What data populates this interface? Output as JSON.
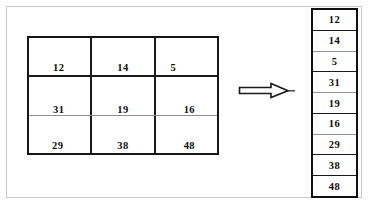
{
  "diagram": {
    "frame": {
      "border_color": "#c9c9c9",
      "background": "#ffffff"
    },
    "matrix": {
      "name": "3x3 matrix",
      "rows": 3,
      "cols": 3,
      "border_color": "#161616",
      "cells": [
        [
          "12",
          "14",
          "5"
        ],
        [
          "31",
          "19",
          "16"
        ],
        [
          "29",
          "38",
          "48"
        ]
      ]
    },
    "arrow": {
      "icon": "arrow-right-outline-icon",
      "direction": "right",
      "stroke_color": "#1a1a1a",
      "fill_color": "#ffffff"
    },
    "list": {
      "name": "vertical value list",
      "border_color": "#111111",
      "items": [
        "12",
        "14",
        "5",
        "31",
        "19",
        "16",
        "29",
        "38",
        "48"
      ]
    }
  }
}
